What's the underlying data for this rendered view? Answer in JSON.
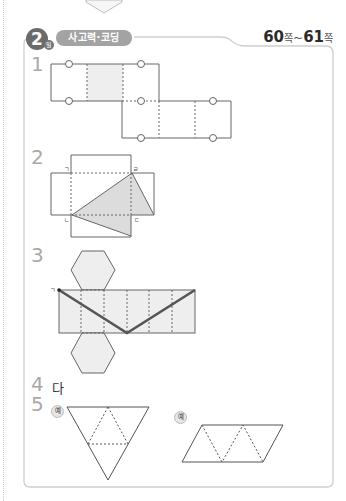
{
  "header": {
    "day_number": "2",
    "day_unit": "일",
    "section_title": "사고력·코딩",
    "page_range": {
      "start": "60",
      "start_unit": "쪽",
      "separator": "~",
      "end": "61",
      "end_unit": "쪽"
    }
  },
  "questions": [
    {
      "number": "1",
      "type": "figure",
      "figure": "cube-net-with-circles"
    },
    {
      "number": "2",
      "type": "figure",
      "figure": "cuboid-net-with-shaded-triangle",
      "vertex_labels": [
        "ㄱ",
        "ㄹ",
        "ㄴ",
        "ㄷ"
      ]
    },
    {
      "number": "3",
      "type": "figure",
      "figure": "hexagonal-prism-net-with-path",
      "vertex_labels": [
        "ㄱ"
      ]
    },
    {
      "number": "4",
      "type": "text",
      "answer": "다"
    },
    {
      "number": "5",
      "type": "figure",
      "example_label": "예",
      "figures": [
        "tetrahedron-net-triangle",
        "tetrahedron-net-parallelogram"
      ]
    }
  ],
  "colors": {
    "badge": "#6b6b6b",
    "pill": "#a3a3a3",
    "question_number": "#a9a9a9",
    "shade": "#dcdcdc",
    "frame": "#cfcfcf",
    "line": "#555555",
    "path": "#555555"
  }
}
